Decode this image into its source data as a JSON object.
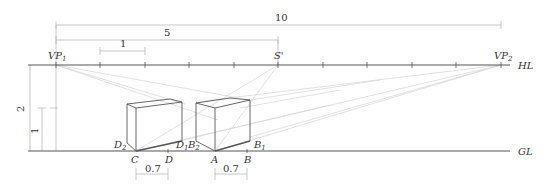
{
  "diagram": {
    "type": "two-point perspective construction",
    "lines": {
      "horizon": {
        "label": "HL",
        "y": 65,
        "x_start": 28,
        "x_end": 510
      },
      "ground": {
        "label": "GL",
        "y": 151,
        "x_start": 28,
        "x_end": 510
      }
    },
    "vanishing_points": [
      {
        "id": "vp1",
        "label": "VP",
        "sub": "1",
        "x": 56
      },
      {
        "id": "vp2",
        "label": "VP",
        "sub": "2",
        "x": 501
      }
    ],
    "station_point_label": "S'",
    "station_point_x": 278,
    "horizon_ticks_x": [
      56,
      100,
      145,
      189,
      234,
      278,
      323,
      367,
      412,
      456,
      501
    ],
    "dimensions": {
      "total": "10",
      "half": "5",
      "unit": "1",
      "height_total": "2",
      "height_unit": "1",
      "depth_left": "0.7",
      "depth_right": "0.7"
    },
    "points": {
      "A": "A",
      "B": "B",
      "B1": "B",
      "B1_sub": "1",
      "B2": "B",
      "B2_sub": "2",
      "C": "C",
      "D": "D",
      "D1": "D",
      "D1_sub": "1",
      "D2": "D",
      "D2_sub": "2"
    },
    "colors": {
      "main_line": "#555555",
      "construction_line": "#d4d4d4",
      "dimension_line": "#b0b0b0",
      "label": "#333333"
    }
  }
}
